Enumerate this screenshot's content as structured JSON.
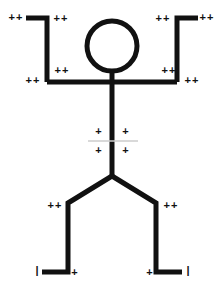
{
  "canvas": {
    "width": 223,
    "height": 288,
    "background": "#ffffff",
    "stroke_color": "#111111",
    "faint_line_color": "#cccccc"
  },
  "figure": {
    "name": "stick-figure",
    "stroke_width": 5,
    "head": {
      "cx": 112,
      "cy": 46,
      "r": 25
    },
    "neck": {
      "x": 112,
      "y1": 71,
      "y2": 82
    },
    "shoulder_line": {
      "x1": 47,
      "x2": 177,
      "y": 82
    },
    "torso": {
      "x": 112,
      "y1": 82,
      "y2": 176
    },
    "left_arm": {
      "elbow_x": 47,
      "elbow_y": 82,
      "shoulder_y": 82,
      "hand_x": 26,
      "hand_y": 18
    },
    "right_arm": {
      "elbow_x": 177,
      "elbow_y": 82,
      "shoulder_y": 82,
      "hand_x": 198,
      "hand_y": 18
    },
    "hip": {
      "x": 112,
      "y": 176
    },
    "left_leg": {
      "knee_x": 68,
      "knee_y": 203,
      "ankle_x": 68,
      "ankle_y": 272,
      "foot_x": 42,
      "foot_y": 272
    },
    "right_leg": {
      "knee_x": 156,
      "knee_y": 203,
      "ankle_x": 156,
      "ankle_y": 272,
      "foot_x": 182,
      "foot_y": 272
    },
    "waist_guide": {
      "x1": 88,
      "x2": 138,
      "y": 141
    }
  },
  "marks": [
    {
      "id": "left-hand-outer",
      "label": "++",
      "kind": "double",
      "x": 16,
      "y": 17
    },
    {
      "id": "left-hand-inner",
      "label": "++",
      "kind": "double",
      "x": 61,
      "y": 18
    },
    {
      "id": "right-hand-inner",
      "label": "++",
      "kind": "double",
      "x": 163,
      "y": 18
    },
    {
      "id": "right-hand-outer",
      "label": "++",
      "kind": "double",
      "x": 207,
      "y": 17
    },
    {
      "id": "left-shoulder-outer",
      "label": "++",
      "kind": "double",
      "x": 33,
      "y": 80
    },
    {
      "id": "left-elbow-inner",
      "label": "++",
      "kind": "double",
      "x": 62,
      "y": 70
    },
    {
      "id": "right-elbow-inner",
      "label": "++",
      "kind": "double",
      "x": 169,
      "y": 70
    },
    {
      "id": "right-shoulder-outer",
      "label": "++",
      "kind": "double",
      "x": 192,
      "y": 80
    },
    {
      "id": "waist-upper-left",
      "label": "+",
      "kind": "single",
      "x": 99,
      "y": 131
    },
    {
      "id": "waist-upper-right",
      "label": "+",
      "kind": "single",
      "x": 126,
      "y": 131
    },
    {
      "id": "waist-lower-left",
      "label": "+",
      "kind": "single",
      "x": 99,
      "y": 150
    },
    {
      "id": "waist-lower-right",
      "label": "+",
      "kind": "single",
      "x": 126,
      "y": 150
    },
    {
      "id": "left-knee",
      "label": "++",
      "kind": "double",
      "x": 55,
      "y": 205
    },
    {
      "id": "right-knee",
      "label": "++",
      "kind": "double",
      "x": 171,
      "y": 205
    },
    {
      "id": "left-foot-tip",
      "label": "|",
      "kind": "tick",
      "x": 37,
      "y": 270
    },
    {
      "id": "left-ankle",
      "label": "+",
      "kind": "single",
      "x": 75,
      "y": 272
    },
    {
      "id": "right-ankle",
      "label": "+",
      "kind": "single",
      "x": 150,
      "y": 272
    },
    {
      "id": "right-foot-tip",
      "label": "|",
      "kind": "tick",
      "x": 188,
      "y": 270
    }
  ]
}
